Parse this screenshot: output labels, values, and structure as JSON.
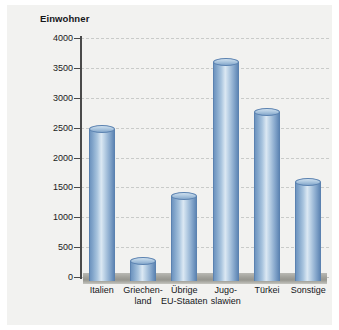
{
  "chart_data": {
    "type": "bar",
    "title": "Einwohner",
    "xlabel": "",
    "ylabel": "Einwohner",
    "categories": [
      "Italien",
      "Griechen-\nland",
      "Übrige\nEU-Staaten",
      "Jugo-\nslawien",
      "Türkei",
      "Sonstige"
    ],
    "values": [
      2550,
      330,
      1430,
      3660,
      2830,
      1660
    ],
    "ylim": [
      0,
      4000
    ],
    "yticks": [
      0,
      500,
      1000,
      1500,
      2000,
      2500,
      3000,
      3500,
      4000
    ],
    "ytick_labels": [
      "0",
      "500",
      "1000",
      "1500",
      "2000",
      "2500",
      "3000",
      "3500",
      "4000"
    ],
    "grid": true,
    "legend": null,
    "series": [
      {
        "name": "Einwohner",
        "values": [
          2550,
          330,
          1430,
          3660,
          2830,
          1660
        ]
      }
    ],
    "bar_color": "#8fb2d4",
    "grid_color": "#c9cbc9",
    "axis_color": "#4a4a4a",
    "background_color": "#f2f2f0"
  }
}
